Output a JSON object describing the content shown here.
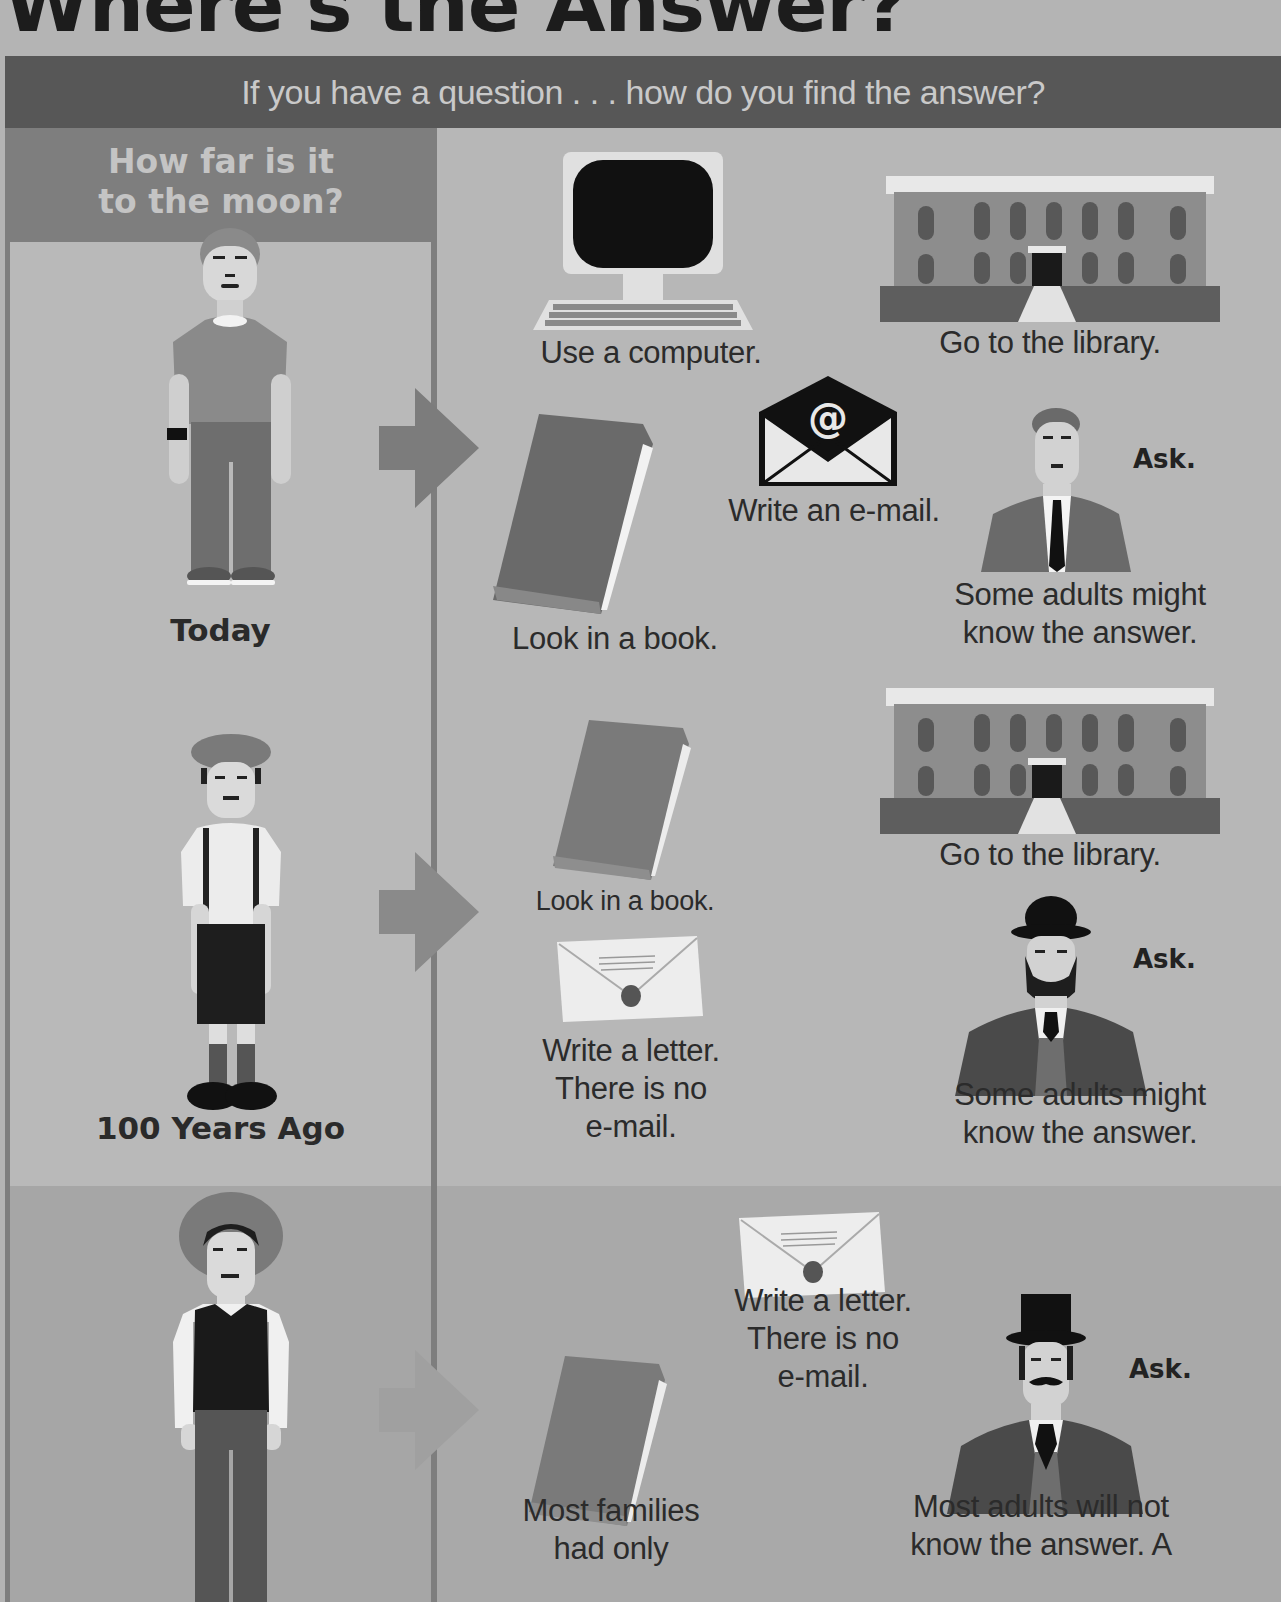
{
  "title": "Where's the Answer?",
  "banner": "If you have a question . . . how do you find the answer?",
  "question": {
    "line1": "How far is it",
    "line2": "to the moon?"
  },
  "rows": [
    {
      "label": "Today",
      "figure": "boy-modern-icon",
      "items": [
        {
          "icon": "computer-icon",
          "caption": "Use a computer."
        },
        {
          "icon": "library-icon",
          "caption": "Go to the library."
        },
        {
          "icon": "book-icon",
          "caption": "Look in a book."
        },
        {
          "icon": "email-envelope-icon",
          "caption": "Write an e-mail."
        },
        {
          "icon": "man-suit-icon",
          "ask": "Ask.",
          "caption_l1": "Some adults might",
          "caption_l2": "know the answer."
        }
      ]
    },
    {
      "label": "100 Years Ago",
      "figure": "boy-flatcap-icon",
      "items": [
        {
          "icon": "book-icon",
          "caption": "Look in a book."
        },
        {
          "icon": "library-icon",
          "caption": "Go to the library."
        },
        {
          "icon": "letter-envelope-icon",
          "caption_l1": "Write a letter.",
          "caption_l2": "There is no",
          "caption_l3": "e-mail."
        },
        {
          "icon": "man-bowler-icon",
          "ask": "Ask.",
          "caption_l1": "Some adults might",
          "caption_l2": "know the answer."
        }
      ]
    },
    {
      "label": "",
      "figure": "boy-hat-vest-icon",
      "items": [
        {
          "icon": "letter-envelope-icon",
          "caption_l1": "Write a letter.",
          "caption_l2": "There is no",
          "caption_l3": "e-mail."
        },
        {
          "icon": "book-icon",
          "caption_l1": "Most families",
          "caption_l2": "had only"
        },
        {
          "icon": "man-tophat-icon",
          "ask": "Ask.",
          "caption_l1": "Most adults will not",
          "caption_l2": "know the answer. A"
        }
      ]
    }
  ],
  "colors": {
    "background": "#b4b4b4",
    "banner": "#575757",
    "question_box": "#7e7e7e",
    "arrow": "#7c7c7c"
  }
}
